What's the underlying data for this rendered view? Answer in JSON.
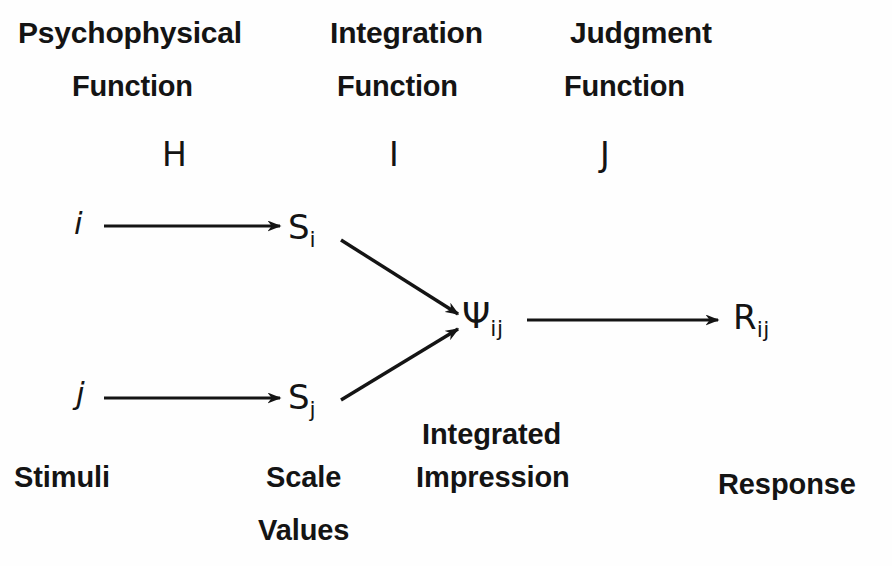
{
  "diagram": {
    "background_color": "#fefefe",
    "ink_color": "#141414",
    "columns": [
      {
        "id": "psychophysical",
        "header_line1": "Psychophysical",
        "header_line2": "Function",
        "operator": "H"
      },
      {
        "id": "integration",
        "header_line1": "Integration",
        "header_line2": "Function",
        "operator": "I"
      },
      {
        "id": "judgment",
        "header_line1": "Judgment",
        "header_line2": "Function",
        "operator": "J"
      }
    ],
    "nodes": [
      {
        "id": "stimulus-i",
        "symbol": "i",
        "subscript": ""
      },
      {
        "id": "stimulus-j",
        "symbol": "j",
        "subscript": ""
      },
      {
        "id": "scale-value-si",
        "symbol": "S",
        "subscript": "i"
      },
      {
        "id": "scale-value-sj",
        "symbol": "S",
        "subscript": "j"
      },
      {
        "id": "integrated-impression-psi",
        "symbol": "Ψ",
        "subscript": "ij"
      },
      {
        "id": "response-r",
        "symbol": "R",
        "subscript": "ij"
      }
    ],
    "captions": [
      {
        "id": "stimuli",
        "line1": "Stimuli",
        "line2": ""
      },
      {
        "id": "scale-values",
        "line1": "Scale",
        "line2": "Values"
      },
      {
        "id": "integrated-impression",
        "line1": "Integrated",
        "line2": "Impression"
      },
      {
        "id": "response",
        "line1": "Response",
        "line2": ""
      }
    ],
    "arrows": [
      {
        "id": "arrow-i-to-si",
        "from": "stimulus-i",
        "to": "scale-value-si",
        "kind": "horizontal"
      },
      {
        "id": "arrow-j-to-sj",
        "from": "stimulus-j",
        "to": "scale-value-sj",
        "kind": "horizontal"
      },
      {
        "id": "arrow-si-to-psi",
        "from": "scale-value-si",
        "to": "integrated-impression-psi",
        "kind": "diagonal-down"
      },
      {
        "id": "arrow-sj-to-psi",
        "from": "scale-value-sj",
        "to": "integrated-impression-psi",
        "kind": "diagonal-up"
      },
      {
        "id": "arrow-psi-to-r",
        "from": "integrated-impression-psi",
        "to": "response-r",
        "kind": "horizontal"
      }
    ]
  }
}
